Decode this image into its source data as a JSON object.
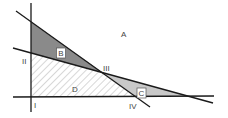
{
  "diagram": {
    "regions": {
      "A": "A",
      "B": "B",
      "C": "C",
      "D": "D"
    },
    "points": {
      "I": "I",
      "II": "II",
      "III": "III",
      "IV": "IV"
    },
    "colors": {
      "line": "#1a1a1a",
      "region_b": "#8a8a8a",
      "region_c": "#c8c8c8",
      "hatch": "#9a9a9a",
      "background": "#ffffff"
    }
  }
}
